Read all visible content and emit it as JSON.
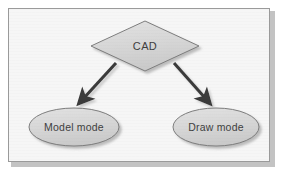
{
  "figure": {
    "kind": "flow-diagram",
    "background_color": "#ffffff",
    "panel_background_color": "#f6f6f6",
    "frame_border_color": "#9a9a9a",
    "frame_shadow_color": "#b9b9b9"
  },
  "nodes": {
    "root": {
      "label": "CAD",
      "shape": "diamond",
      "fill_color": "#d5d5d5",
      "stroke_color": "#7d7d7d",
      "text_color": "#3f3f3f"
    },
    "left": {
      "label": "Model mode",
      "shape": "ellipse",
      "fill_color": "#d7d7d7",
      "stroke_color": "#7d7d7d",
      "text_color": "#3f3f3f"
    },
    "right": {
      "label": "Draw mode",
      "shape": "ellipse",
      "fill_color": "#d7d7d7",
      "stroke_color": "#7d7d7d",
      "text_color": "#3f3f3f"
    }
  },
  "connectors": [
    {
      "id": "cad-to-model-mode",
      "from": "CAD",
      "to": "Model mode",
      "style": "solid-arrow",
      "color": "#3a3a3a"
    },
    {
      "id": "cad-to-draw-mode",
      "from": "CAD",
      "to": "Draw mode",
      "style": "solid-arrow",
      "color": "#3a3a3a"
    }
  ]
}
